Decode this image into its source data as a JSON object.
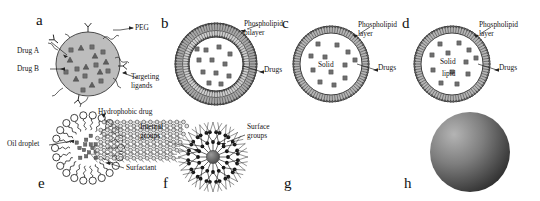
{
  "figure": {
    "type": "scientific-schematic",
    "panel_count": 8
  },
  "panels": [
    {
      "id": "a",
      "letter": "a",
      "name": "polymeric-nanoparticle",
      "labels": [
        {
          "key": "peg",
          "text": "PEG"
        },
        {
          "key": "drug_a",
          "text": "Drug A"
        },
        {
          "key": "drug_b",
          "text": "Drug B"
        },
        {
          "key": "targeting_ligands_l1",
          "text": "Targeting"
        },
        {
          "key": "targeting_ligands_l2",
          "text": "ligands"
        }
      ]
    },
    {
      "id": "b",
      "letter": "b",
      "name": "liposome",
      "labels": [
        {
          "key": "bilayer_l1",
          "text": "Phospholipid"
        },
        {
          "key": "bilayer_l2",
          "text": "bilayer"
        },
        {
          "key": "drugs",
          "text": "Drugs"
        }
      ]
    },
    {
      "id": "c",
      "letter": "c",
      "name": "solid-lipid-nanoparticle",
      "labels": [
        {
          "key": "layer_l1",
          "text": "Phospholipid"
        },
        {
          "key": "layer_l2",
          "text": "layer"
        },
        {
          "key": "drugs",
          "text": "Drugs"
        },
        {
          "key": "core",
          "text": "Solid"
        }
      ]
    },
    {
      "id": "d",
      "letter": "d",
      "name": "nanostructured-lipid-carrier",
      "labels": [
        {
          "key": "layer_l1",
          "text": "Phospholipid"
        },
        {
          "key": "layer_l2",
          "text": "layer"
        },
        {
          "key": "drugs",
          "text": "Drugs"
        },
        {
          "key": "core_l1",
          "text": "Solid"
        },
        {
          "key": "core_l2",
          "text": "lipid"
        }
      ]
    },
    {
      "id": "e",
      "letter": "e",
      "name": "nanoemulsion",
      "labels": [
        {
          "key": "hydrophobic_drug",
          "text": "Hydrophobic drug"
        },
        {
          "key": "oil_droplet",
          "text": "Oil droplet"
        },
        {
          "key": "surfactant",
          "text": "Surfactant"
        }
      ]
    },
    {
      "id": "f",
      "letter": "f",
      "name": "dendrimer",
      "labels": [
        {
          "key": "internal_l1",
          "text": "Internal"
        },
        {
          "key": "internal_l2",
          "text": "groups"
        },
        {
          "key": "surface_l1",
          "text": "Surface"
        },
        {
          "key": "surface_l2",
          "text": "groups"
        }
      ]
    },
    {
      "id": "g",
      "letter": "g",
      "name": "graphene-carbon-nanosheet",
      "labels": []
    },
    {
      "id": "h",
      "letter": "h",
      "name": "inorganic-metallic-nanoparticle",
      "labels": []
    }
  ],
  "colors": {
    "ink": "#1a1a1a",
    "particle_fill": "#b9b9b9",
    "membrane": "#8e8e8e",
    "drug_square": "#6e6e6e",
    "background": "#ffffff"
  }
}
